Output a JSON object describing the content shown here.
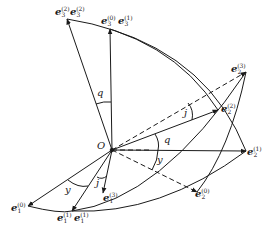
{
  "diagram": {
    "origin_label": "O",
    "vectors": [
      {
        "id": "e3_2",
        "base": "e",
        "sub": "3",
        "sup": "(2)"
      },
      {
        "id": "e3_2b",
        "base": "e",
        "sub": "3",
        "sup": "(2)"
      },
      {
        "id": "e3_0",
        "base": "e",
        "sub": "3",
        "sup": "(0)"
      },
      {
        "id": "e3_1",
        "base": "e",
        "sub": "3",
        "sup": "(1)"
      },
      {
        "id": "e2_3",
        "base": "e",
        "sub": "2",
        "sup": "(3)"
      },
      {
        "id": "e2_2",
        "base": "e",
        "sub": "2",
        "sup": "(2)"
      },
      {
        "id": "e2_1",
        "base": "e",
        "sub": "2",
        "sup": "(1)"
      },
      {
        "id": "e2_0",
        "base": "e",
        "sub": "2",
        "sup": "(0)"
      },
      {
        "id": "e1_0",
        "base": "e",
        "sub": "1",
        "sup": "(0)"
      },
      {
        "id": "e1_1",
        "base": "e",
        "sub": "1",
        "sup": "(1)"
      },
      {
        "id": "e1_1b",
        "base": "e",
        "sub": "1",
        "sup": "(1)"
      },
      {
        "id": "e1_3",
        "base": "e",
        "sub": "1",
        "sup": "(3)"
      }
    ],
    "angles": {
      "q_top": "q",
      "q_right": "q",
      "j_right": "j",
      "j_bottom": "j",
      "y_right": "y",
      "y_bottom": "y"
    },
    "colors": {
      "line": "#1a1a1a",
      "background": "#ffffff"
    }
  }
}
